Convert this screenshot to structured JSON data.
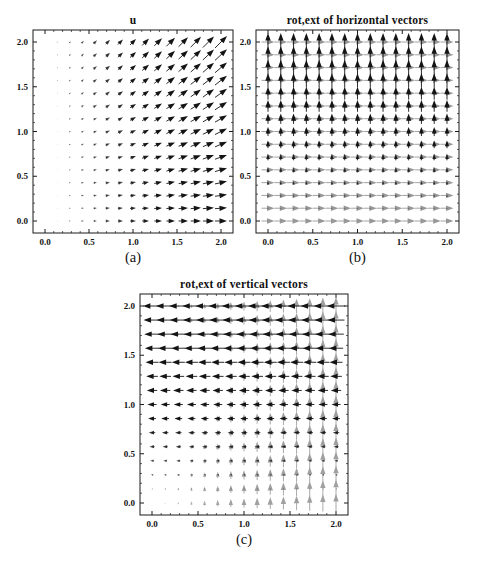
{
  "figure": {
    "background": "#ffffff",
    "black_arrow_color": "#141414",
    "gray_arrow_color": "#979797",
    "frame_color": "#1a1a1a"
  },
  "chart_data": [
    {
      "id": "a",
      "type": "quiver",
      "title": "u",
      "caption": "(a)",
      "x_range": [
        0,
        2
      ],
      "y_range": [
        0,
        2
      ],
      "grid_points": 15,
      "axis_ticks": {
        "labels": [
          "0.0",
          "0.5",
          "1.0",
          "1.5",
          "2.0"
        ],
        "values": [
          0,
          0.5,
          1,
          1.5,
          2
        ],
        "minor_step": 0.1
      },
      "fields": [
        {
          "name": "u-field",
          "color": "#141414",
          "vx": "x",
          "vy": "0.5*x*y"
        }
      ],
      "layout": {
        "frame": {
          "left": 33,
          "top": 30,
          "width": 200,
          "height": 203
        },
        "px_per_unit": 6,
        "padding_px": 12,
        "legend": "none",
        "grid": "off"
      }
    },
    {
      "id": "b",
      "type": "quiver",
      "title": "rot,ext of horizontal vectors",
      "caption": "(b)",
      "x_range": [
        0,
        2
      ],
      "y_range": [
        0,
        2
      ],
      "grid_points": 15,
      "axis_ticks": {
        "labels": [
          "0.0",
          "0.5",
          "1.0",
          "1.5",
          "2.0"
        ],
        "values": [
          0,
          0.5,
          1,
          1.5,
          2
        ],
        "minor_step": 0.1
      },
      "fields": [
        {
          "name": "horizontal-vectors",
          "color": "#979797",
          "vx": "1",
          "vy": "0"
        },
        {
          "name": "rot-ext-vectors",
          "color": "#141414",
          "vx": "0",
          "vy": "0.7*y"
        }
      ],
      "layout": {
        "frame": {
          "left": 256,
          "top": 30,
          "width": 203,
          "height": 203
        },
        "px_per_unit": 13,
        "padding_px": 12,
        "legend": "none",
        "grid": "off"
      }
    },
    {
      "id": "c",
      "type": "quiver",
      "title": "rot,ext of vertical vectors",
      "caption": "(c)",
      "x_range": [
        0,
        2
      ],
      "y_range": [
        0,
        2
      ],
      "grid_points": 15,
      "axis_ticks": {
        "labels": [
          "0.0",
          "0.5",
          "1.0",
          "1.5",
          "2.0"
        ],
        "values": [
          0,
          0.5,
          1,
          1.5,
          2
        ],
        "minor_step": 0.1
      },
      "fields": [
        {
          "name": "vertical-vectors",
          "color": "#a0a0a0",
          "vx": "0",
          "vy": "0.7*x"
        },
        {
          "name": "rot-ext-vectors",
          "color": "#141414",
          "vx": "-0.7*y",
          "vy": "0"
        }
      ],
      "layout": {
        "frame": {
          "left": 140,
          "top": 294,
          "width": 208,
          "height": 221
        },
        "px_per_unit": 13,
        "padding_px": 12,
        "legend": "none",
        "grid": "off"
      }
    }
  ]
}
